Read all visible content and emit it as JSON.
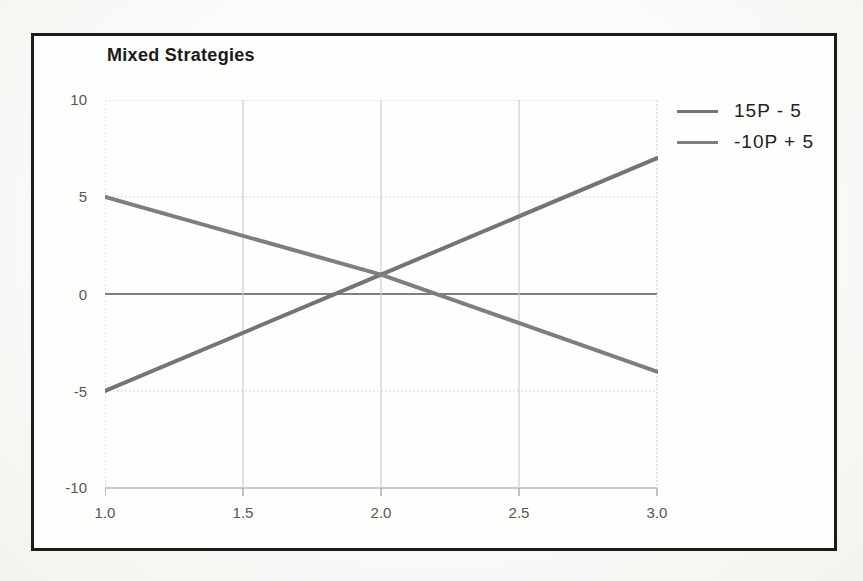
{
  "chart_data": {
    "type": "line",
    "title": "Mixed Strategies",
    "xlabel": "",
    "ylabel": "",
    "xlim": [
      1.0,
      3.0
    ],
    "ylim": [
      -10,
      10
    ],
    "grid": true,
    "legend_position": "top-right",
    "x_tick_labels": [
      "1.0",
      "1.5",
      "2.0",
      "2.5",
      "3.0"
    ],
    "x_tick_values": [
      1.0,
      1.5,
      2.0,
      2.5,
      3.0
    ],
    "y_tick_labels": [
      "10",
      "5",
      "0",
      "-5",
      "-10"
    ],
    "y_tick_values": [
      10,
      5,
      0,
      -5,
      -10
    ],
    "x": [
      1.0,
      2.0,
      3.0
    ],
    "series": [
      {
        "name": "15P - 5",
        "values": [
          -5,
          1,
          7
        ],
        "color": "#747474"
      },
      {
        "name": "-10P + 5",
        "values": [
          5,
          1,
          -4
        ],
        "color": "#7e7e7e"
      }
    ],
    "intersection": {
      "x": 2.0,
      "y": 1.0
    }
  },
  "styles": {
    "frame_border_color": "#1b1b1b",
    "grid_color": "#cccccc",
    "grid_dashed_color": "#c6c6c6",
    "zero_line_color": "#7f7f7f",
    "axis_line_color": "#b8b8b8",
    "tick_mark_color": "#9d9d9d",
    "line_width": 4
  }
}
